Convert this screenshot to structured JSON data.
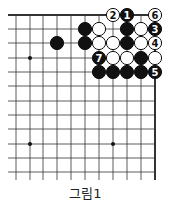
{
  "caption": "그림1",
  "board": {
    "cols_x": [
      16,
      30,
      43,
      57,
      71,
      85,
      99,
      113,
      127,
      141,
      155
    ],
    "rows_y": [
      15,
      29,
      43,
      58,
      72,
      86,
      101,
      115,
      129,
      144,
      158,
      172
    ],
    "top_edge": true,
    "right_edge": true,
    "star_points": [
      [
        1,
        3
      ],
      [
        1,
        9
      ],
      [
        7,
        9
      ]
    ],
    "stones": [
      {
        "col": 7,
        "row": 0,
        "color": "white",
        "label": "2"
      },
      {
        "col": 8,
        "row": 0,
        "color": "black",
        "label": "1"
      },
      {
        "col": 10,
        "row": 0,
        "color": "white",
        "label": "6"
      },
      {
        "col": 5,
        "row": 1,
        "color": "black",
        "label": ""
      },
      {
        "col": 6,
        "row": 1,
        "color": "white",
        "label": ""
      },
      {
        "col": 8,
        "row": 1,
        "color": "black",
        "label": ""
      },
      {
        "col": 9,
        "row": 1,
        "color": "white",
        "label": ""
      },
      {
        "col": 10,
        "row": 1,
        "color": "black",
        "label": "3"
      },
      {
        "col": 3,
        "row": 2,
        "color": "black",
        "label": ""
      },
      {
        "col": 5,
        "row": 2,
        "color": "black",
        "label": ""
      },
      {
        "col": 6,
        "row": 2,
        "color": "white",
        "label": ""
      },
      {
        "col": 7,
        "row": 2,
        "color": "white",
        "label": ""
      },
      {
        "col": 8,
        "row": 2,
        "color": "black",
        "label": ""
      },
      {
        "col": 9,
        "row": 2,
        "color": "white",
        "label": ""
      },
      {
        "col": 10,
        "row": 2,
        "color": "white",
        "label": "4"
      },
      {
        "col": 6,
        "row": 3,
        "color": "black",
        "label": "7"
      },
      {
        "col": 7,
        "row": 3,
        "color": "white",
        "label": ""
      },
      {
        "col": 8,
        "row": 3,
        "color": "white",
        "label": ""
      },
      {
        "col": 9,
        "row": 3,
        "color": "black",
        "label": ""
      },
      {
        "col": 10,
        "row": 3,
        "color": "white",
        "label": ""
      },
      {
        "col": 6,
        "row": 4,
        "color": "black",
        "label": ""
      },
      {
        "col": 7,
        "row": 4,
        "color": "black",
        "label": ""
      },
      {
        "col": 8,
        "row": 4,
        "color": "black",
        "label": ""
      },
      {
        "col": 9,
        "row": 4,
        "color": "black",
        "label": ""
      },
      {
        "col": 10,
        "row": 4,
        "color": "black",
        "label": "5"
      }
    ]
  }
}
